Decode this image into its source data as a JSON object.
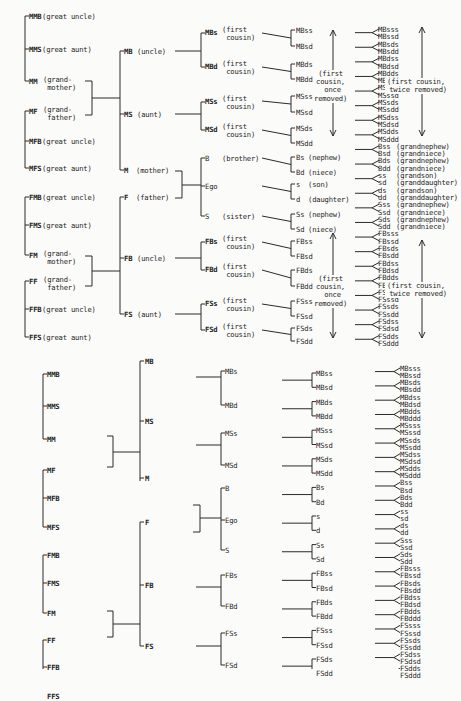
{
  "diagram": {
    "labeled": {
      "generation_plus2": [
        {
          "code": "MMB",
          "gloss": "(great uncle)",
          "x": 5,
          "y": 13
        },
        {
          "code": "MMS",
          "gloss": "(great aunt)",
          "x": 5,
          "y": 46
        },
        {
          "code": "MM",
          "gloss": "(grand-\n mother)",
          "x": 5,
          "y": 78
        },
        {
          "code": "MF",
          "gloss": "(grand-\n father)",
          "x": 5,
          "y": 108
        },
        {
          "code": "MFB",
          "gloss": "(great uncle)",
          "x": 5,
          "y": 138
        },
        {
          "code": "MFS",
          "gloss": "(great aunt)",
          "x": 5,
          "y": 165
        },
        {
          "code": "FMB",
          "gloss": "(great uncle)",
          "x": 5,
          "y": 194
        },
        {
          "code": "FMS",
          "gloss": "(great aunt)",
          "x": 5,
          "y": 222
        },
        {
          "code": "FM",
          "gloss": "(grand-\n mother)",
          "x": 5,
          "y": 252
        },
        {
          "code": "FF",
          "gloss": "(grand-\n father)",
          "x": 5,
          "y": 278
        },
        {
          "code": "FFB",
          "gloss": "(great uncle)",
          "x": 5,
          "y": 306
        },
        {
          "code": "FFS",
          "gloss": "(great aunt)",
          "x": 5,
          "y": 334
        }
      ],
      "generation_plus1": [
        {
          "code": "MB",
          "gloss": "(uncle)",
          "x": 120,
          "y": 48
        },
        {
          "code": "MS",
          "gloss": "(aunt)",
          "x": 120,
          "y": 111
        },
        {
          "code": "M",
          "gloss": "(mother)",
          "x": 120,
          "y": 167
        },
        {
          "code": "F",
          "gloss": "(father)",
          "x": 120,
          "y": 194
        },
        {
          "code": "FB",
          "gloss": "(uncle)",
          "x": 120,
          "y": 255
        },
        {
          "code": "FS",
          "gloss": "(aunt)",
          "x": 120,
          "y": 311
        }
      ],
      "generation_0": [
        {
          "code": "MBs",
          "gloss": "(first\n cousin)",
          "x": 203,
          "y": 29
        },
        {
          "code": "MBd",
          "gloss": "(first\n cousin)",
          "x": 203,
          "y": 63
        },
        {
          "code": "MSs",
          "gloss": "(first\n cousin)",
          "x": 203,
          "y": 98
        },
        {
          "code": "MSd",
          "gloss": "(first\n cousin)",
          "x": 203,
          "y": 126
        },
        {
          "code": "B",
          "gloss": "(brother)",
          "x": 203,
          "y": 155
        },
        {
          "code": "Ego",
          "gloss": "",
          "x": 203,
          "y": 183
        },
        {
          "code": "S",
          "gloss": "(sister)",
          "x": 203,
          "y": 213
        },
        {
          "code": "FBs",
          "gloss": "(first\n cousin)",
          "x": 203,
          "y": 238
        },
        {
          "code": "FBd",
          "gloss": "(first\n cousin)",
          "x": 203,
          "y": 266
        },
        {
          "code": "FSs",
          "gloss": "(first\n cousin)",
          "x": 203,
          "y": 300
        },
        {
          "code": "FSd",
          "gloss": "(first\n cousin)",
          "x": 203,
          "y": 326
        }
      ],
      "generation_minus1": [
        {
          "code": "MBss",
          "gloss": "",
          "y": 27
        },
        {
          "code": "MBsd",
          "gloss": "",
          "y": 43
        },
        {
          "code": "MBds",
          "gloss": "",
          "y": 61
        },
        {
          "code": "MBdd",
          "gloss": "",
          "y": 76
        },
        {
          "code": "MSss",
          "gloss": "",
          "y": 93
        },
        {
          "code": "MSsd",
          "gloss": "",
          "y": 109
        },
        {
          "code": "MSds",
          "gloss": "",
          "y": 125
        },
        {
          "code": "MSdd",
          "gloss": "",
          "y": 140
        },
        {
          "code": "Bs",
          "gloss": "(nephew)",
          "y": 154
        },
        {
          "code": "Bd",
          "gloss": "(niece)",
          "y": 169
        },
        {
          "code": "s",
          "gloss": "(son)",
          "y": 181
        },
        {
          "code": "d",
          "gloss": "(daughter)",
          "y": 196
        },
        {
          "code": "Ss",
          "gloss": "(nephew)",
          "y": 211
        },
        {
          "code": "Sd",
          "gloss": "(niece)",
          "y": 226
        },
        {
          "code": "FBss",
          "gloss": "",
          "y": 238
        },
        {
          "code": "FBsd",
          "gloss": "",
          "y": 253
        },
        {
          "code": "FBds",
          "gloss": "",
          "y": 267
        },
        {
          "code": "FBdd",
          "gloss": "",
          "y": 283
        },
        {
          "code": "FSss",
          "gloss": "",
          "y": 298
        },
        {
          "code": "FSsd",
          "gloss": "",
          "y": 313
        },
        {
          "code": "FSds",
          "gloss": "",
          "y": 325
        },
        {
          "code": "FSdd",
          "gloss": "",
          "y": 338
        }
      ],
      "generation_minus2": [
        {
          "code": "MBsss",
          "gloss": ""
        },
        {
          "code": "MBssd",
          "gloss": ""
        },
        {
          "code": "MBsds",
          "gloss": ""
        },
        {
          "code": "MBsdd",
          "gloss": ""
        },
        {
          "code": "MBdss",
          "gloss": ""
        },
        {
          "code": "MBdsd",
          "gloss": ""
        },
        {
          "code": "MBdds",
          "gloss": ""
        },
        {
          "code": "MBddd",
          "gloss": ""
        },
        {
          "code": "MSsss",
          "gloss": ""
        },
        {
          "code": "MSssd",
          "gloss": ""
        },
        {
          "code": "MSsds",
          "gloss": ""
        },
        {
          "code": "MSsdd",
          "gloss": ""
        },
        {
          "code": "MSdss",
          "gloss": ""
        },
        {
          "code": "MSdsd",
          "gloss": ""
        },
        {
          "code": "MSdds",
          "gloss": ""
        },
        {
          "code": "MSddd",
          "gloss": ""
        },
        {
          "code": "Bss",
          "gloss": "(grandnephew)"
        },
        {
          "code": "Bsd",
          "gloss": "(grandniece)"
        },
        {
          "code": "Bds",
          "gloss": "(grandnephew)"
        },
        {
          "code": "Bdd",
          "gloss": "(grandniece)"
        },
        {
          "code": "ss",
          "gloss": "(grandson)"
        },
        {
          "code": "sd",
          "gloss": "(granddaughter)"
        },
        {
          "code": "ds",
          "gloss": "(grandson)"
        },
        {
          "code": "dd",
          "gloss": "(granddaughter)"
        },
        {
          "code": "Sss",
          "gloss": "(grandnephew)"
        },
        {
          "code": "Ssd",
          "gloss": "(grandniece)"
        },
        {
          "code": "Sds",
          "gloss": "(grandnephew)"
        },
        {
          "code": "Sdd",
          "gloss": "(grandniece)"
        },
        {
          "code": "FBsss",
          "gloss": ""
        },
        {
          "code": "FBssd",
          "gloss": ""
        },
        {
          "code": "FBsds",
          "gloss": ""
        },
        {
          "code": "FBsdd",
          "gloss": ""
        },
        {
          "code": "FBdss",
          "gloss": ""
        },
        {
          "code": "FBdsd",
          "gloss": ""
        },
        {
          "code": "FBdds",
          "gloss": ""
        },
        {
          "code": "FBddd",
          "gloss": ""
        },
        {
          "code": "FSsss",
          "gloss": ""
        },
        {
          "code": "FSssd",
          "gloss": ""
        },
        {
          "code": "FSsds",
          "gloss": ""
        },
        {
          "code": "FSsdd",
          "gloss": ""
        },
        {
          "code": "FSdss",
          "gloss": ""
        },
        {
          "code": "FSdsd",
          "gloss": ""
        },
        {
          "code": "FSdds",
          "gloss": ""
        },
        {
          "code": "FSddd",
          "gloss": ""
        }
      ],
      "annotations": [
        {
          "text": "(first\ncousin,\n once\nremoved)",
          "x": 314,
          "y": 70
        },
        {
          "text": "(first cousin,\n twice removed)",
          "x": 385,
          "y": 78
        },
        {
          "text": "(first\ncousin,\n once\nremoved)",
          "x": 314,
          "y": 275
        },
        {
          "text": "(first cousin,\n twice removed)",
          "x": 385,
          "y": 282
        }
      ]
    },
    "unlabeled": {
      "generation_plus2": [
        "MMB",
        "MMS",
        "MM",
        "MF",
        "MFB",
        "MFS",
        "FMB",
        "FMS",
        "FM",
        "FF",
        "FFB",
        "FFS"
      ],
      "generation_plus1": [
        "MB",
        "MS",
        "M",
        "F",
        "FB",
        "FS"
      ],
      "generation_0": [
        "MBs",
        "MBd",
        "MSs",
        "MSd",
        "B",
        "Ego",
        "S",
        "FBs",
        "FBd",
        "FSs",
        "FSd"
      ],
      "generation_minus1": [
        "MBss",
        "MBsd",
        "MBds",
        "MBdd",
        "MSss",
        "MSsd",
        "MSds",
        "MSdd",
        "Bs",
        "Bd",
        "s",
        "d",
        "Ss",
        "Sd",
        "FBss",
        "FBsd",
        "FBds",
        "FBdd",
        "FSss",
        "FSsd",
        "FSds",
        "FSdd"
      ],
      "generation_minus2": [
        "MBsss",
        "MBssd",
        "MBsds",
        "MBsdd",
        "MBdss",
        "MBdsd",
        "MBdds",
        "MBddd",
        "MSsss",
        "MSssd",
        "MSsds",
        "MSsdd",
        "MSdss",
        "MSdsd",
        "MSdds",
        "MSddd",
        "Bss",
        "Bsd",
        "Bds",
        "Bdd",
        "ss",
        "sd",
        "ds",
        "dd",
        "Sss",
        "Ssd",
        "Sds",
        "Sdd",
        "FBsss",
        "FBssd",
        "FBsds",
        "FBsdd",
        "FBdss",
        "FBdsd",
        "FBdds",
        "FBddd",
        "FSsss",
        "FSssd",
        "FSsds",
        "FSsdd",
        "FSdss",
        "FSdsd",
        "FSdds",
        "FSddd"
      ]
    }
  }
}
